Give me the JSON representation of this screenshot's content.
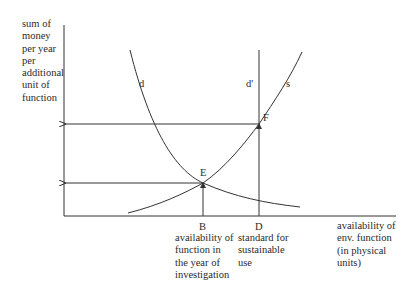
{
  "diagram": {
    "y_axis_label": "sum of\nmoney\nper year\nper\nadditional\nunit of\nfunction",
    "x_axis_label": "availability of\nenv. function\n(in physical\nunits)",
    "curves": {
      "demand": "d",
      "demand_sustainable": "d'",
      "supply": "s"
    },
    "points": {
      "E": "E",
      "F": "F"
    },
    "x_markers": {
      "B": {
        "letter": "B",
        "description": "availability of\nfunction in\nthe year of\ninvestigation"
      },
      "D": {
        "letter": "D",
        "description": "standard for\nsustainable\nuse"
      }
    },
    "colors": {
      "line": "#333333",
      "background": "#ffffff"
    }
  }
}
